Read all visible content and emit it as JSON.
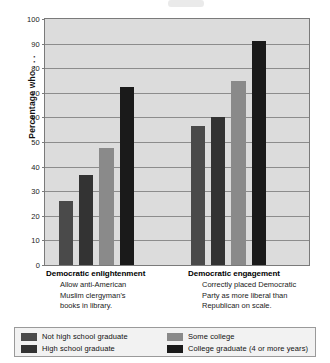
{
  "chart_data": {
    "type": "bar",
    "title": "",
    "xlabel": "",
    "ylabel": "Percentage who . . .",
    "ylim": [
      0,
      100
    ],
    "ytick_step": 10,
    "yticks": [
      0,
      10,
      20,
      30,
      40,
      50,
      60,
      70,
      80,
      90,
      100
    ],
    "grid": true,
    "legend_position": "bottom",
    "categories": [
      "Democratic enlightenment",
      "Democratic engagement"
    ],
    "category_subtitles": [
      "Allow anti-American Muslim clergyman's books in library.",
      "Correctly placed Democratic Party as more liberal than Republican on scale."
    ],
    "series": [
      {
        "name": "Not high school graduate",
        "color": "#4a4a4a",
        "values": [
          26,
          56.5
        ]
      },
      {
        "name": "High school graduate",
        "color": "#333333",
        "values": [
          36.5,
          60
        ]
      },
      {
        "name": "Some college",
        "color": "#8a8a8a",
        "values": [
          47.5,
          75
        ]
      },
      {
        "name": "College graduate (4 or more years)",
        "color": "#1a1a1a",
        "values": [
          72.5,
          91
        ]
      }
    ]
  },
  "axis": {
    "y_title": "Percentage who . . .",
    "tick_labels": [
      "100",
      "90",
      "80",
      "70",
      "60",
      "50",
      "40",
      "30",
      "20",
      "10",
      "0"
    ]
  },
  "groups": [
    {
      "title": "Democratic enlightenment",
      "lines": [
        "Allow anti-American",
        "Muslim clergyman's",
        "books in library."
      ]
    },
    {
      "title": "Democratic engagement",
      "lines": [
        "Correctly placed Democratic",
        "Party as more liberal than",
        "Republican on scale."
      ]
    }
  ],
  "legend": {
    "items": [
      {
        "label": "Not high school graduate",
        "color": "#4a4a4a"
      },
      {
        "label": "High school graduate",
        "color": "#333333"
      },
      {
        "label": "Some college",
        "color": "#8a8a8a"
      },
      {
        "label": "College graduate (4 or more years)",
        "color": "#1a1a1a"
      }
    ]
  },
  "colors": {
    "plot_background": "#dcdcdc",
    "plot_border": "#7a7a7a",
    "gridline": "#8c8c8c",
    "legend_background": "#f2f2f2",
    "legend_border": "#9a9a9a",
    "page_background": "#ffffff"
  }
}
